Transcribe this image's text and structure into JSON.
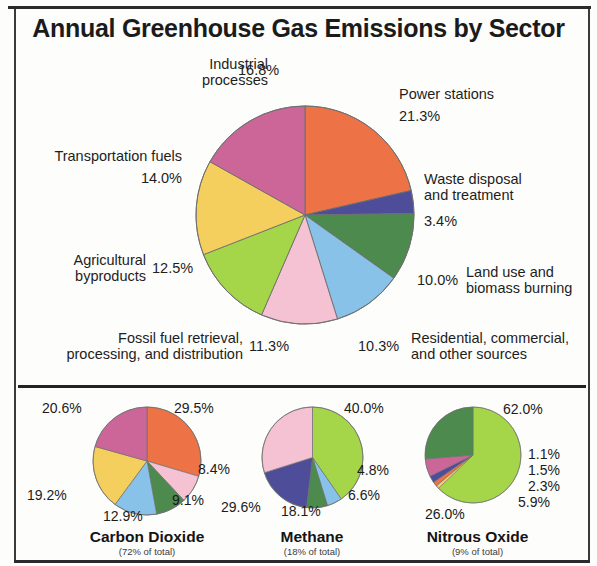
{
  "title": "Annual Greenhouse Gas Emissions by Sector",
  "colors": {
    "orange": "#ED7245",
    "dark_blue": "#4D4D99",
    "dark_green": "#4D8A4D",
    "light_blue": "#89C2E8",
    "pink": "#F4C2D2",
    "light_green": "#A5D64A",
    "yellow": "#F5CF5E",
    "magenta": "#CC6699",
    "outline": "#6e6e6e",
    "text": "#1e1e1e",
    "rule": "#232323"
  },
  "main_labels": {
    "power_stations": {
      "name": "Power stations",
      "pct": "21.3%"
    },
    "waste": {
      "name_line1": "Waste disposal",
      "name_line2": "and treatment",
      "pct": "3.4%"
    },
    "land_use": {
      "name_line1": "Land use and",
      "name_line2": "biomass burning",
      "pct": "10.0%"
    },
    "residential": {
      "name_line1": "Residential, commercial,",
      "name_line2": "and other sources",
      "pct": "10.3%"
    },
    "fossil_fuel": {
      "name_line1": "Fossil fuel retrieval,",
      "name_line2": "processing, and distribution",
      "pct": "11.3%"
    },
    "agricultural": {
      "name_line1": "Agricultural",
      "name_line2": "byproducts",
      "pct": "12.5%"
    },
    "transportation": {
      "name": "Transportation fuels",
      "pct": "14.0%"
    },
    "industrial": {
      "name_line1": "Industrial",
      "name_line2": "processes",
      "pct": "16.8%"
    }
  },
  "small_charts": {
    "co2": {
      "title": "Carbon Dioxide",
      "subtitle": "(72% of total)",
      "p1": "29.5%",
      "p2": "8.4%",
      "p3": "9.1%",
      "p4": "12.9%",
      "p5": "19.2%",
      "p6": "20.6%"
    },
    "ch4": {
      "title": "Methane",
      "subtitle": "(18% of total)",
      "p1": "40.0%",
      "p2": "4.8%",
      "p3": "6.6%",
      "p4": "18.1%",
      "p5": "29.6%"
    },
    "n2o": {
      "title": "Nitrous Oxide",
      "subtitle": "(9% of total)",
      "p1": "62.0%",
      "p2": "1.1%",
      "p3": "1.5%",
      "p4": "2.3%",
      "p5": "5.9%",
      "p6": "26.0%"
    }
  },
  "chart_data": [
    {
      "type": "pie",
      "id": "main",
      "title": "Annual Greenhouse Gas Emissions by Sector",
      "unit": "percent",
      "start_angle_deg": 0,
      "direction": "clockwise",
      "categories": [
        "Power stations",
        "Waste disposal and treatment",
        "Land use and biomass burning",
        "Residential, commercial, and other sources",
        "Fossil fuel retrieval, processing, and distribution",
        "Agricultural byproducts",
        "Transportation fuels",
        "Industrial processes"
      ],
      "values": [
        21.3,
        3.4,
        10.0,
        10.3,
        11.3,
        12.5,
        14.0,
        16.8
      ],
      "slice_colors": [
        "#ED7245",
        "#4D4D99",
        "#4D8A4D",
        "#89C2E8",
        "#F4C2D2",
        "#A5D64A",
        "#F5CF5E",
        "#CC6699"
      ],
      "labels": [
        "21.3%",
        "3.4%",
        "10.0%",
        "10.3%",
        "11.3%",
        "12.5%",
        "14.0%",
        "16.8%"
      ],
      "legend": "none (direct labels around pie)",
      "total": 99.6
    },
    {
      "type": "pie",
      "id": "carbon-dioxide",
      "title": "Carbon Dioxide",
      "subtitle": "(72% of total)",
      "unit": "percent",
      "start_angle_deg": 0,
      "direction": "clockwise",
      "categories": [
        "29.5%",
        "8.4%",
        "9.1%",
        "12.9%",
        "19.2%",
        "20.6%"
      ],
      "values": [
        29.5,
        8.4,
        9.1,
        12.9,
        19.2,
        20.6
      ],
      "slice_colors": [
        "#ED7245",
        "#F4C2D2",
        "#4D8A4D",
        "#89C2E8",
        "#F5CF5E",
        "#CC6699"
      ],
      "labels": [
        "29.5%",
        "8.4%",
        "9.1%",
        "12.9%",
        "19.2%",
        "20.6%"
      ],
      "total": 99.7
    },
    {
      "type": "pie",
      "id": "methane",
      "title": "Methane",
      "subtitle": "(18% of total)",
      "unit": "percent",
      "start_angle_deg": 0,
      "direction": "clockwise",
      "categories": [
        "40.0%",
        "4.8%",
        "6.6%",
        "18.1%",
        "29.6%"
      ],
      "values": [
        40.0,
        4.8,
        6.6,
        18.1,
        29.6
      ],
      "slice_colors": [
        "#A5D64A",
        "#89C2E8",
        "#4D8A4D",
        "#4D4D99",
        "#F4C2D2"
      ],
      "labels": [
        "40.0%",
        "4.8%",
        "6.6%",
        "18.1%",
        "29.6%"
      ],
      "total": 99.1
    },
    {
      "type": "pie",
      "id": "nitrous-oxide",
      "title": "Nitrous Oxide",
      "subtitle": "(9% of total)",
      "unit": "percent",
      "start_angle_deg": 0,
      "direction": "clockwise",
      "categories": [
        "62.0%",
        "1.1%",
        "1.5%",
        "2.3%",
        "5.9%",
        "26.0%"
      ],
      "values": [
        62.0,
        1.1,
        1.5,
        2.3,
        5.9,
        26.0
      ],
      "slice_colors": [
        "#A5D64A",
        "#F5CF5E",
        "#ED7245",
        "#4D4D99",
        "#CC6699",
        "#4D8A4D"
      ],
      "labels": [
        "62.0%",
        "1.1%",
        "1.5%",
        "2.3%",
        "5.9%",
        "26.0%"
      ],
      "total": 98.8
    }
  ]
}
